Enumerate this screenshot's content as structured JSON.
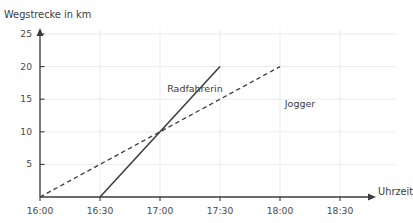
{
  "figure": {
    "cutoff_top_text": "",
    "background_color": "#ffffff",
    "ink_color": "#3b3b3b",
    "grid_color": "#ebebeb"
  },
  "chart_data": {
    "type": "line",
    "title": "",
    "xlabel": "Uhrzeit",
    "ylabel": "Wegstrecke in km",
    "grid": true,
    "legend_position": "inline-annotation",
    "x_tick_labels": [
      "16:00",
      "16:30",
      "17:00",
      "17:30",
      "18:00",
      "18:30"
    ],
    "x_tick_values": [
      0,
      0.5,
      1,
      1.5,
      2,
      2.5
    ],
    "y_tick_labels": [
      "5",
      "10",
      "15",
      "20",
      "25"
    ],
    "y_tick_values": [
      5,
      10,
      15,
      20,
      25
    ],
    "xlim": [
      0,
      2.8
    ],
    "ylim": [
      0,
      27
    ],
    "series": [
      {
        "name": "Radfahrerin",
        "style": "solid",
        "color": "#3b3b3b",
        "x": [
          0.5,
          1.5
        ],
        "y": [
          0,
          20
        ],
        "x_labels": [
          "16:30",
          "17:30"
        ],
        "slope_km_per_h": 20,
        "label_x": 1.06,
        "label_y": 16.6
      },
      {
        "name": "Jogger",
        "style": "dashed",
        "color": "#3b3b3b",
        "x": [
          0,
          2.0
        ],
        "y": [
          0,
          20
        ],
        "x_labels": [
          "16:00",
          "18:00"
        ],
        "slope_km_per_h": 10,
        "label_x": 2.04,
        "label_y": 14.2
      }
    ],
    "annotations": [
      {
        "name": "intersection",
        "x": 1.0,
        "y": 10,
        "x_label": "17:00",
        "y_label": "10"
      }
    ]
  }
}
